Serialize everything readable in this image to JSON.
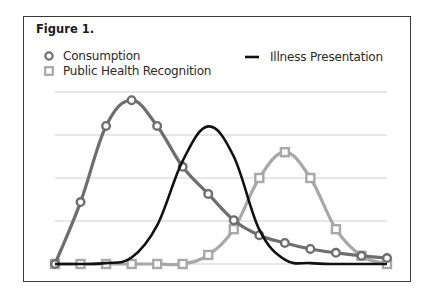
{
  "figure": {
    "title": "Figure 1."
  },
  "legend": {
    "items": [
      {
        "label": "Consumption",
        "marker": "circle",
        "color": "#6e6e6e"
      },
      {
        "label": "Public Health Recognition",
        "marker": "square",
        "color": "#a8a8a8"
      },
      {
        "label": "Illness Presentation",
        "marker": "line",
        "color": "#111111"
      }
    ]
  },
  "chart_data": {
    "type": "line",
    "title": "Figure 1.",
    "xlabel": "",
    "ylabel": "",
    "x": [
      0,
      1,
      2,
      3,
      4,
      5,
      6,
      7,
      8,
      9,
      10,
      11,
      12,
      13
    ],
    "ylim": [
      0,
      4
    ],
    "grid": true,
    "gridlines_y": [
      1,
      2,
      3,
      4
    ],
    "legend_position": "top",
    "series": [
      {
        "name": "Consumption",
        "marker": "circle",
        "color": "#6e6e6e",
        "values": [
          0,
          1.44,
          3.21,
          3.81,
          3.21,
          2.26,
          1.63,
          1.02,
          0.67,
          0.49,
          0.35,
          0.26,
          0.19,
          0.14
        ]
      },
      {
        "name": "Public Health Recognition",
        "marker": "square",
        "color": "#a8a8a8",
        "values": [
          0,
          0,
          0,
          0,
          0,
          0,
          0.21,
          0.81,
          2.0,
          2.6,
          2.0,
          0.81,
          0.19,
          0
        ]
      },
      {
        "name": "Illness Presentation",
        "marker": "none",
        "color": "#111111",
        "values": [
          0,
          0,
          0.02,
          0.15,
          0.9,
          2.4,
          3.2,
          2.5,
          0.8,
          0.1,
          0.02,
          0,
          0,
          0
        ]
      }
    ]
  }
}
